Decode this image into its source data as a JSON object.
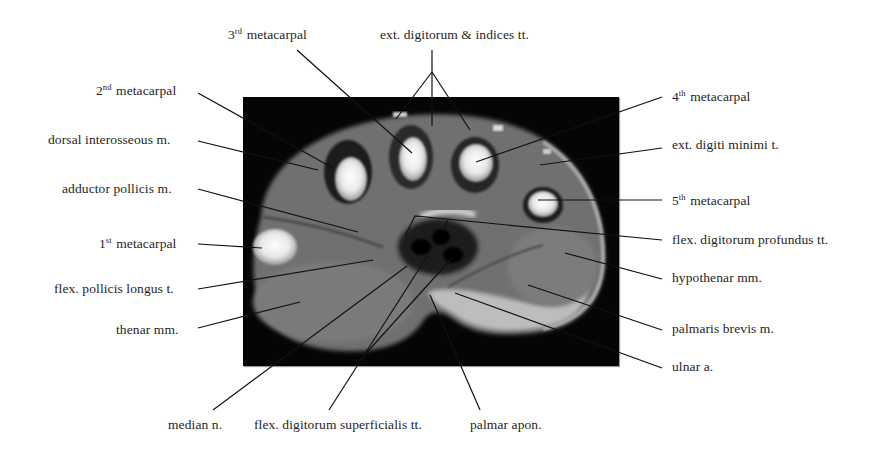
{
  "figure": {
    "image_bbox": {
      "x": 243,
      "y": 97,
      "width": 376,
      "height": 269
    },
    "colors": {
      "background": "#ffffff",
      "image_frame": "#050505",
      "text": "#1e1e1e",
      "leader_line": "#111111"
    }
  },
  "labels": {
    "third_metacarpal": {
      "ordinal": "3",
      "suffix": "rd",
      "text": "metacarpal"
    },
    "ext_digitorum_indices": {
      "text": "ext. digitorum & indices  tt."
    },
    "second_metacarpal": {
      "ordinal": "2",
      "suffix": "nd",
      "text": "metacarpal"
    },
    "fourth_metacarpal": {
      "ordinal": "4",
      "suffix": "th",
      "text": "metacarpal"
    },
    "dorsal_interosseous": {
      "text": "dorsal  interosseous  m."
    },
    "ext_digiti_minimi": {
      "text": "ext. digiti minimi t."
    },
    "adductor_pollicis": {
      "text": "adductor pollicis  m."
    },
    "fifth_metacarpal": {
      "ordinal": "5",
      "suffix": "th",
      "text": "metacarpal"
    },
    "first_metacarpal": {
      "ordinal": "1",
      "suffix": "st",
      "text": "metacarpal"
    },
    "flex_digitorum_profundus": {
      "text": "flex. digitorum profundus tt."
    },
    "flex_pollicis_longus": {
      "text": "flex. pollicis longus t."
    },
    "hypothenar": {
      "text": "hypothenar  mm."
    },
    "thenar": {
      "text": "thenar  mm."
    },
    "palmaris_brevis": {
      "text": "palmaris brevis  m."
    },
    "ulnar_artery": {
      "text": "ulnar a."
    },
    "median_nerve": {
      "text": "median n."
    },
    "flex_digitorum_superficialis": {
      "text": "flex. digitorum superficialis tt."
    },
    "palmar_aponeurosis": {
      "text": "palmar apon."
    }
  }
}
